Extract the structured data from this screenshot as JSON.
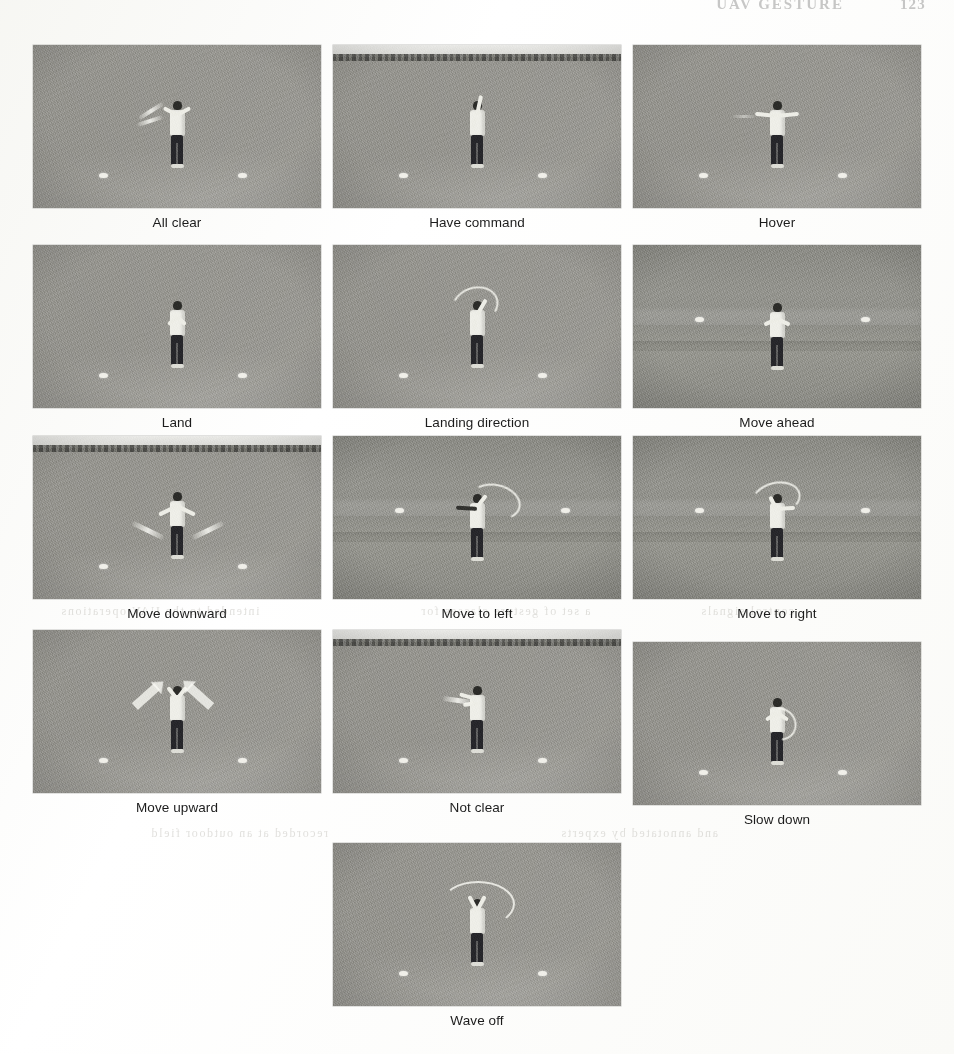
{
  "page": {
    "running_head_title": "UAV GESTURE",
    "running_head_page": "123",
    "background_color": "#fdfdfb",
    "caption_color": "#1c1c1c"
  },
  "ghost_text": [
    {
      "text": "intended to the UAV operations",
      "x": 60,
      "y": 604
    },
    {
      "text": "a set of gesture classes for",
      "x": 420,
      "y": 604
    },
    {
      "text": "control signals",
      "x": 700,
      "y": 604
    },
    {
      "text": "recorded at an outdoor field",
      "x": 150,
      "y": 826
    },
    {
      "text": "and annotated by experts",
      "x": 560,
      "y": 826
    }
  ],
  "figure": {
    "columns": 3,
    "panel_count": 13,
    "rows": [
      {
        "top": 45,
        "panels": [
          {
            "caption": "All clear",
            "scene": "vfield",
            "pose": "all-clear"
          },
          {
            "caption": "Have command",
            "scene": "horizon",
            "pose": "have-command"
          },
          {
            "caption": "Hover",
            "scene": "vfield",
            "pose": "hover"
          }
        ]
      },
      {
        "top": 245,
        "panels": [
          {
            "caption": "Land",
            "scene": "vfield",
            "pose": "land"
          },
          {
            "caption": "Landing direction",
            "scene": "vfield",
            "pose": "landing-direction"
          },
          {
            "caption": "Move ahead",
            "scene": "flat",
            "pose": "move-ahead"
          }
        ]
      },
      {
        "top": 436,
        "panels": [
          {
            "caption": "Move downward",
            "scene": "horizon",
            "pose": "move-downward"
          },
          {
            "caption": "Move to left",
            "scene": "flat",
            "pose": "move-to-left"
          },
          {
            "caption": "Move to right",
            "scene": "flat",
            "pose": "move-to-right"
          }
        ]
      },
      {
        "top": 630,
        "panels": [
          {
            "caption": "Move upward",
            "scene": "vfield",
            "pose": "move-upward"
          },
          {
            "caption": "Not clear",
            "scene": "horizon",
            "pose": "not-clear"
          },
          {
            "caption": "Slow down",
            "scene": "vfield",
            "pose": "slow-down",
            "offset_top": 12
          }
        ]
      },
      {
        "top": 843,
        "panels": [
          {
            "caption": "Wave off",
            "scene": "vfield",
            "pose": "wave-off"
          }
        ]
      }
    ]
  }
}
